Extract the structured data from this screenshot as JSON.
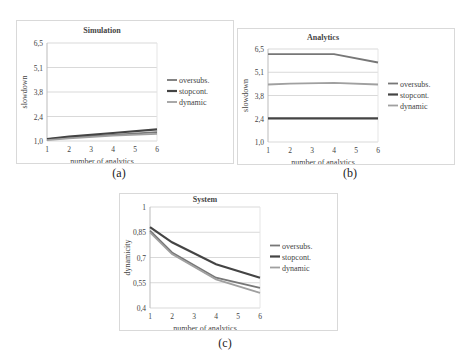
{
  "captions": [
    "(a)",
    "(b)",
    "(c)"
  ],
  "colors": {
    "oversubs": "#777777",
    "stopcont": "#444444",
    "dynamic": "#a0a0a0",
    "grid": "#d9d9d9"
  },
  "chart_data": [
    {
      "type": "line",
      "title": "Simulation",
      "xlabel": "number of analytics",
      "ylabel": "slowdown",
      "x": [
        1,
        2,
        4,
        6
      ],
      "xticks": [
        "1",
        "2",
        "3",
        "4",
        "5",
        "6"
      ],
      "yticks": [
        "1,0",
        "2,4",
        "3,8",
        "5,1",
        "6,5"
      ],
      "ylim": [
        1.0,
        6.5
      ],
      "grid": true,
      "legend_position": "right",
      "series": [
        {
          "name": "oversubs.",
          "values": [
            1.1,
            1.2,
            1.35,
            1.5
          ]
        },
        {
          "name": "stopcont.",
          "values": [
            1.1,
            1.25,
            1.45,
            1.65
          ]
        },
        {
          "name": "dynamic",
          "values": [
            1.05,
            1.15,
            1.3,
            1.4
          ]
        }
      ]
    },
    {
      "type": "line",
      "title": "Analytics",
      "xlabel": "number of analytics",
      "ylabel": "slowdown",
      "x": [
        1,
        2,
        4,
        6
      ],
      "xticks": [
        "1",
        "2",
        "3",
        "4",
        "5",
        "6"
      ],
      "yticks": [
        "1,0",
        "2,4",
        "3,8",
        "5,1",
        "6,5"
      ],
      "ylim": [
        1.0,
        6.5
      ],
      "grid": true,
      "legend_position": "right",
      "series": [
        {
          "name": "oversubs.",
          "values": [
            6.2,
            6.2,
            6.2,
            5.7
          ]
        },
        {
          "name": "stopcont.",
          "values": [
            2.4,
            2.4,
            2.4,
            2.4
          ]
        },
        {
          "name": "dynamic",
          "values": [
            4.4,
            4.45,
            4.5,
            4.4
          ]
        }
      ]
    },
    {
      "type": "line",
      "title": "System",
      "xlabel": "number of analytics",
      "ylabel": "dynamicity",
      "x": [
        1,
        2,
        4,
        6
      ],
      "xticks": [
        "1",
        "2",
        "3",
        "4",
        "5",
        "6"
      ],
      "yticks": [
        "0,4",
        "0,55",
        "0,7",
        "0,85",
        "1"
      ],
      "ylim": [
        0.4,
        1.0
      ],
      "grid": true,
      "legend_position": "right",
      "series": [
        {
          "name": "oversubs.",
          "values": [
            0.86,
            0.73,
            0.58,
            0.52
          ]
        },
        {
          "name": "stopcont.",
          "values": [
            0.88,
            0.79,
            0.66,
            0.58
          ]
        },
        {
          "name": "dynamic",
          "values": [
            0.85,
            0.72,
            0.57,
            0.49
          ]
        }
      ]
    }
  ]
}
